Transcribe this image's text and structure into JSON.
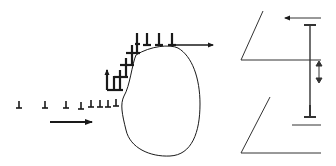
{
  "diagram": {
    "colors": {
      "stroke": "#1a1a1a",
      "background": "#ffffff",
      "line_gray": "#333333"
    },
    "left_panel": {
      "glide_row_dislocations_x": [
        19,
        45,
        66,
        81,
        91,
        100,
        108,
        116
      ],
      "glide_row_y": 107,
      "glide_arrow": {
        "x1": 50,
        "x2": 92,
        "y": 122,
        "direction": "right"
      },
      "staircase_rows": [
        {
          "y": 89,
          "xs": [
            108,
            115,
            121
          ]
        },
        {
          "y": 77,
          "xs": [
            121,
            127
          ]
        },
        {
          "y": 64,
          "xs": [
            127,
            133
          ]
        },
        {
          "y": 52,
          "xs": [
            133,
            139
          ]
        }
      ],
      "climb_arrow": {
        "x": 107,
        "y1": 90,
        "y2": 72,
        "direction": "up"
      },
      "top_row_dislocations_x": [
        135,
        147,
        159,
        172
      ],
      "top_row_y": 45,
      "top_arrow": {
        "x1": 172,
        "x2": 213,
        "y": 45,
        "direction": "right"
      },
      "particle": "irregular rounded obstacle"
    },
    "right_panel": {
      "upper_plane": {
        "diag_from": [
          241,
          60
        ],
        "diag_to": [
          263,
          11
        ],
        "horizontal_to": [
          321,
          60
        ]
      },
      "lower_plane": {
        "diag_from": [
          241,
          153
        ],
        "diag_to": [
          270,
          97
        ],
        "horizontal_to": [
          321,
          153
        ]
      },
      "short_line": {
        "x1": 292,
        "x2": 321,
        "y": 125
      },
      "left_arrow": {
        "x1": 321,
        "x2": 285,
        "y": 18,
        "direction": "left"
      },
      "vertical_dislocation_segment": {
        "x": 310,
        "y_top": 25,
        "y_bottom": 117
      },
      "double_arrow": {
        "x": 319,
        "y1": 62,
        "y2": 80
      }
    }
  }
}
